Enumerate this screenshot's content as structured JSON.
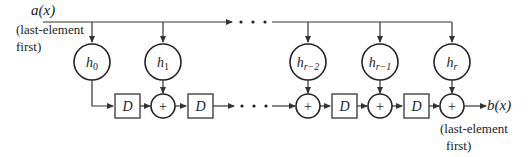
{
  "diagram": {
    "type": "transversal-filter",
    "input": {
      "label": "a(x)",
      "note_line1": "(last-element",
      "note_line2": "first)"
    },
    "output": {
      "label": "b(x)",
      "note_line1": "(last-element",
      "note_line2": "first)"
    },
    "taps": [
      {
        "id": "h0",
        "base": "h",
        "sub": "0"
      },
      {
        "id": "h1",
        "base": "h",
        "sub": "1"
      },
      {
        "id": "hr-2",
        "base": "h",
        "sub": "r−2"
      },
      {
        "id": "hr-1",
        "base": "h",
        "sub": "r−1"
      },
      {
        "id": "hr",
        "base": "h",
        "sub": "r"
      }
    ],
    "delay_label": "D",
    "adder_symbol": "+",
    "ellipsis": "• • •"
  }
}
